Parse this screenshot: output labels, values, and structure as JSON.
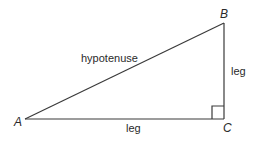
{
  "diagram": {
    "type": "right-triangle",
    "vertices": {
      "A": {
        "label": "A",
        "x": 25,
        "y": 119
      },
      "B": {
        "label": "B",
        "x": 224,
        "y": 23
      },
      "C": {
        "label": "C",
        "x": 224,
        "y": 119
      }
    },
    "sides": {
      "hypotenuse": {
        "label": "hypotenuse",
        "from": "A",
        "to": "B"
      },
      "vertical_leg": {
        "label": "leg",
        "from": "B",
        "to": "C"
      },
      "horizontal_leg": {
        "label": "leg",
        "from": "A",
        "to": "C"
      }
    },
    "right_angle_at": "C",
    "stroke_color": "#3a3a3a",
    "text_color": "#2a2a2a"
  }
}
